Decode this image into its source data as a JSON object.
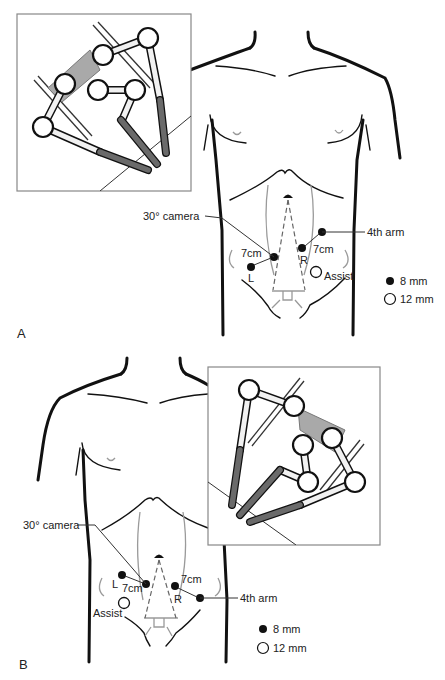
{
  "figure": {
    "panels": [
      {
        "letter": "A",
        "labels": {
          "camera": "30° camera",
          "fourth_arm": "4th arm",
          "dist_left": "7cm",
          "dist_right": "7cm",
          "port_left": "L",
          "port_right": "R",
          "assist": "Assist"
        },
        "legend": [
          {
            "symbol": "filled-circle",
            "label": "8 mm"
          },
          {
            "symbol": "open-circle",
            "label": "12 mm"
          }
        ],
        "inset_position": "top-left"
      },
      {
        "letter": "B",
        "labels": {
          "camera": "30° camera",
          "fourth_arm": "4th arm",
          "dist_left": "7cm",
          "dist_right": "7cm",
          "port_left": "L",
          "port_right": "R",
          "assist": "Assist"
        },
        "legend": [
          {
            "symbol": "filled-circle",
            "label": "8 mm"
          },
          {
            "symbol": "open-circle",
            "label": "12 mm"
          }
        ],
        "inset_position": "top-right"
      }
    ],
    "colors": {
      "port_filled": "#111111",
      "port_open": "#ffffff",
      "instrument": "#6a6a6a",
      "sterile_block": "#a9a9a9"
    }
  }
}
